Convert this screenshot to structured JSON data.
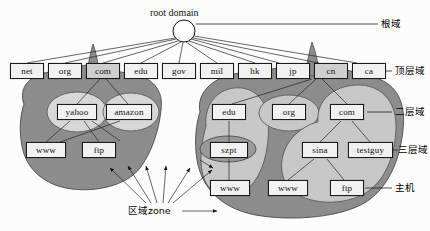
{
  "diagram": {
    "root": {
      "label": "root domain"
    },
    "side_labels": [
      {
        "key": "root",
        "label": "根域"
      },
      {
        "key": "tld",
        "label": "顶层域"
      },
      {
        "key": "second",
        "label": "二层域"
      },
      {
        "key": "third",
        "label": "三层域"
      },
      {
        "key": "host",
        "label": "主机"
      }
    ],
    "zone_annotation": {
      "label": "区域zone"
    },
    "tld_nodes": [
      {
        "label": "net"
      },
      {
        "label": "org"
      },
      {
        "label": "com"
      },
      {
        "label": "edu"
      },
      {
        "label": "gov"
      },
      {
        "label": "mil"
      },
      {
        "label": "hk"
      },
      {
        "label": "jp"
      },
      {
        "label": "cn"
      },
      {
        "label": "ca"
      }
    ],
    "second_level_nodes": [
      {
        "label": "yahoo"
      },
      {
        "label": "amazon"
      },
      {
        "label": "edu"
      },
      {
        "label": "org"
      },
      {
        "label": "com"
      }
    ],
    "third_level_nodes": [
      {
        "label": "www"
      },
      {
        "label": "ftp"
      },
      {
        "label": "szpt"
      },
      {
        "label": "sina"
      },
      {
        "label": "testguy"
      }
    ],
    "host_nodes": [
      {
        "label": "www"
      },
      {
        "label": "www"
      },
      {
        "label": "ftp"
      }
    ],
    "colors": {
      "zone_dark": "#8d8d8d",
      "zone_light": "#c8c8c8",
      "node_fill": "#f2f2f2",
      "node_shaded": "#cfcfcf",
      "line": "#1a1a1a"
    }
  }
}
